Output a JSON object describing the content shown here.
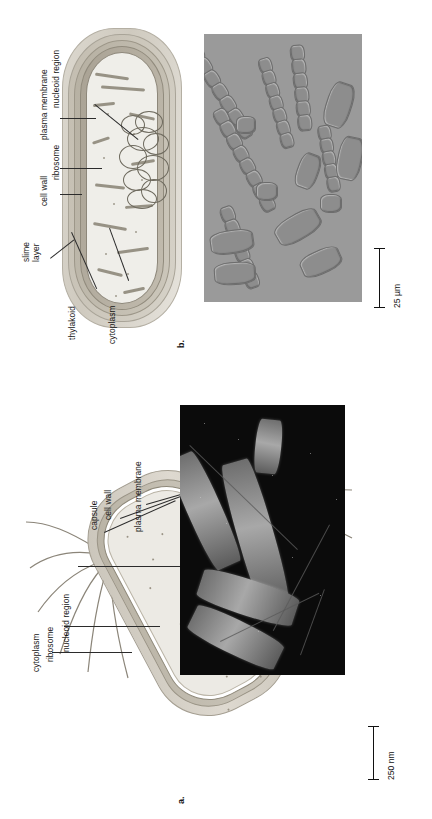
{
  "figure": {
    "orientation": "rotated-90-ccw",
    "background_color": "#ffffff",
    "label_color": "#161616"
  },
  "panel_b": {
    "id": "b.",
    "subject": "cyanobacterium",
    "labels": [
      {
        "text": "nucleoid region",
        "target": "nucleoid"
      },
      {
        "text": "plasma membrane",
        "target": "plasma-membrane"
      },
      {
        "text": "ribosome",
        "target": "ribosome"
      },
      {
        "text": "cell wall",
        "target": "cell-wall"
      },
      {
        "text": "slime",
        "target": "slime-layer-line1"
      },
      {
        "text": "layer",
        "target": "slime-layer-line2"
      },
      {
        "text": "thylakoid",
        "target": "thylakoid"
      },
      {
        "text": "cytoplasm",
        "target": "cytoplasm"
      }
    ],
    "micrograph": {
      "type": "light-micrograph",
      "subject": "filamentous cyanobacteria"
    },
    "scale_bar": {
      "value": "25",
      "unit": "µm",
      "text": "25 µm"
    }
  },
  "panel_a": {
    "id": "a.",
    "subject": "flagellated bacterium",
    "labels": [
      {
        "text": "cytoplasm",
        "target": "cytoplasm"
      },
      {
        "text": "ribosome",
        "target": "ribosome"
      },
      {
        "text": "nucleoid region",
        "target": "nucleoid"
      },
      {
        "text": "capsule",
        "target": "capsule"
      },
      {
        "text": "cell wall",
        "target": "cell-wall"
      },
      {
        "text": "plasma membrane",
        "target": "plasma-membrane"
      }
    ],
    "micrograph": {
      "type": "scanning-electron-micrograph",
      "subject": "rod-shaped bacteria with flagella"
    },
    "scale_bar": {
      "value": "250",
      "unit": "nm",
      "text": "250 nm"
    }
  },
  "edge_caption": {
    "text": ""
  }
}
